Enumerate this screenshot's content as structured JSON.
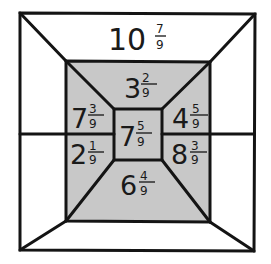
{
  "diagram": {
    "colors": {
      "shaded": "#c8c8c8",
      "line": "#141414",
      "background": "#ffffff"
    },
    "outer_top": {
      "whole": "10",
      "numerator": "7",
      "denominator": "9"
    },
    "middle_top": {
      "whole": "3",
      "numerator": "2",
      "denominator": "9"
    },
    "middle_left_upper": {
      "whole": "7",
      "numerator": "3",
      "denominator": "9"
    },
    "middle_right_upper": {
      "whole": "4",
      "numerator": "5",
      "denominator": "9"
    },
    "center": {
      "whole": "7",
      "numerator": "5",
      "denominator": "9"
    },
    "middle_left_lower": {
      "whole": "2",
      "numerator": "1",
      "denominator": "9"
    },
    "middle_right_lower": {
      "whole": "8",
      "numerator": "3",
      "denominator": "9"
    },
    "middle_bottom": {
      "whole": "6",
      "numerator": "4",
      "denominator": "9"
    }
  }
}
